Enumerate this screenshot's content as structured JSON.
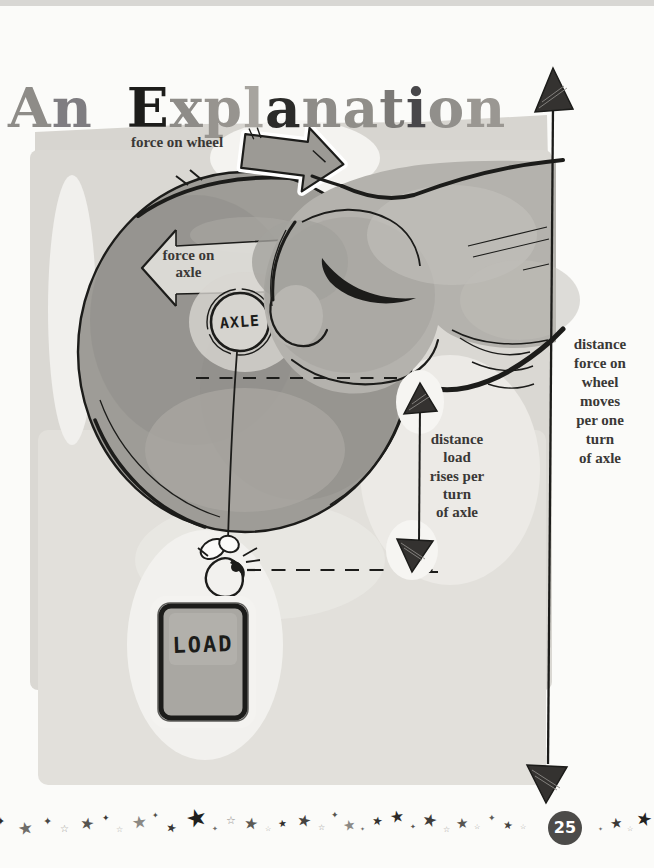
{
  "title": {
    "text": "An Explanation",
    "letters": [
      {
        "ch": "A",
        "color": "#8e8c88"
      },
      {
        "ch": "n",
        "color": "#7f7d81"
      },
      {
        "ch": " ",
        "color": ""
      },
      {
        "ch": "E",
        "color": "#1d1d1b"
      },
      {
        "ch": "x",
        "color": "#8e8c88"
      },
      {
        "ch": "p",
        "color": "#97948f"
      },
      {
        "ch": "l",
        "color": "#a7a49f"
      },
      {
        "ch": "a",
        "color": "#2b2b29"
      },
      {
        "ch": "n",
        "color": "#8e8c88"
      },
      {
        "ch": "a",
        "color": "#908e89"
      },
      {
        "ch": "t",
        "color": "#7b7976"
      },
      {
        "ch": "i",
        "color": "#48474a"
      },
      {
        "ch": "o",
        "color": "#918f8b"
      },
      {
        "ch": "n",
        "color": "#9a9792"
      }
    ]
  },
  "diagram": {
    "force_on_wheel_label": "force on wheel",
    "force_on_axle_label": "force on\naxle",
    "axle_label": "AXLE",
    "load_label": "LOAD",
    "distance_load_label": "distance\nload\nrises per\nturn\nof axle",
    "distance_wheel_label": "distance\nforce on\nwheel\nmoves\nper one\nturn\nof axle",
    "palette": {
      "wash": "#dad8d3",
      "wheel": "#9e9c97",
      "hand": "#b4b2ad",
      "ink": "#1c1c1a",
      "label_text": "#3a3836",
      "page_circle": "#4c4b49"
    }
  },
  "footer": {
    "page_number": "25",
    "stars": [
      {
        "x": -4,
        "y": 816,
        "glyph": "✦",
        "size": 11,
        "color": "#2e2c2a",
        "rot": 0
      },
      {
        "x": 18,
        "y": 820,
        "glyph": "★",
        "size": 17,
        "color": "#6f6d69",
        "rot": -12
      },
      {
        "x": 43,
        "y": 816,
        "glyph": "✦",
        "size": 11,
        "color": "#4a4846",
        "rot": 0
      },
      {
        "x": 60,
        "y": 824,
        "glyph": "☆",
        "size": 10,
        "color": "#9b9995",
        "rot": 0
      },
      {
        "x": 80,
        "y": 816,
        "glyph": "★",
        "size": 16,
        "color": "#55534f",
        "rot": 10
      },
      {
        "x": 102,
        "y": 814,
        "glyph": "✦",
        "size": 9,
        "color": "#3a3836",
        "rot": 0
      },
      {
        "x": 116,
        "y": 826,
        "glyph": "☆",
        "size": 8,
        "color": "#a9a7a3",
        "rot": 0
      },
      {
        "x": 132,
        "y": 814,
        "glyph": "★",
        "size": 17,
        "color": "#8b8985",
        "rot": -8
      },
      {
        "x": 152,
        "y": 812,
        "glyph": "✦",
        "size": 8,
        "color": "#4e4c48",
        "rot": 0
      },
      {
        "x": 166,
        "y": 822,
        "glyph": "★",
        "size": 12,
        "color": "#3a3836",
        "rot": 14
      },
      {
        "x": 186,
        "y": 806,
        "glyph": "★",
        "size": 24,
        "color": "#201f1d",
        "rot": -16
      },
      {
        "x": 212,
        "y": 826,
        "glyph": "✦",
        "size": 7,
        "color": "#6f6d69",
        "rot": 0
      },
      {
        "x": 226,
        "y": 815,
        "glyph": "☆",
        "size": 11,
        "color": "#8f8d89",
        "rot": 0
      },
      {
        "x": 244,
        "y": 816,
        "glyph": "★",
        "size": 16,
        "color": "#5b5955",
        "rot": 8
      },
      {
        "x": 265,
        "y": 826,
        "glyph": "☆",
        "size": 7,
        "color": "#9b9995",
        "rot": 0
      },
      {
        "x": 278,
        "y": 819,
        "glyph": "★",
        "size": 10,
        "color": "#302e2c",
        "rot": -8
      },
      {
        "x": 297,
        "y": 813,
        "glyph": "★",
        "size": 16,
        "color": "#454340",
        "rot": 12
      },
      {
        "x": 318,
        "y": 824,
        "glyph": "☆",
        "size": 8,
        "color": "#8f8d89",
        "rot": 0
      },
      {
        "x": 331,
        "y": 811,
        "glyph": "✦",
        "size": 9,
        "color": "#56544f",
        "rot": 0
      },
      {
        "x": 343,
        "y": 818,
        "glyph": "★",
        "size": 14,
        "color": "#8b8985",
        "rot": -12
      },
      {
        "x": 360,
        "y": 826,
        "glyph": "✦",
        "size": 6,
        "color": "#6f6d69",
        "rot": 0
      },
      {
        "x": 372,
        "y": 815,
        "glyph": "★",
        "size": 12,
        "color": "#343230",
        "rot": 8
      },
      {
        "x": 390,
        "y": 809,
        "glyph": "★",
        "size": 16,
        "color": "#2b2927",
        "rot": -10
      },
      {
        "x": 410,
        "y": 824,
        "glyph": "✦",
        "size": 7,
        "color": "#56544f",
        "rot": 0
      },
      {
        "x": 422,
        "y": 812,
        "glyph": "★",
        "size": 17,
        "color": "#3e3c3a",
        "rot": 14
      },
      {
        "x": 443,
        "y": 826,
        "glyph": "☆",
        "size": 8,
        "color": "#9b9995",
        "rot": 0
      },
      {
        "x": 456,
        "y": 816,
        "glyph": "★",
        "size": 14,
        "color": "#575551",
        "rot": -6
      },
      {
        "x": 474,
        "y": 824,
        "glyph": "☆",
        "size": 7,
        "color": "#8f8d89",
        "rot": 0
      },
      {
        "x": 488,
        "y": 814,
        "glyph": "✦",
        "size": 9,
        "color": "#5e5c58",
        "rot": 0
      },
      {
        "x": 503,
        "y": 820,
        "glyph": "★",
        "size": 11,
        "color": "#44423e",
        "rot": 10
      },
      {
        "x": 520,
        "y": 824,
        "glyph": "☆",
        "size": 7,
        "color": "#9b9995",
        "rot": 0
      },
      {
        "x": 598,
        "y": 826,
        "glyph": "✦",
        "size": 6,
        "color": "#6f6d69",
        "rot": 0
      },
      {
        "x": 610,
        "y": 816,
        "glyph": "★",
        "size": 14,
        "color": "#3a3836",
        "rot": -8
      },
      {
        "x": 627,
        "y": 826,
        "glyph": "☆",
        "size": 7,
        "color": "#9b9995",
        "rot": 0
      },
      {
        "x": 636,
        "y": 810,
        "glyph": "★",
        "size": 18,
        "color": "#232220",
        "rot": 12
      }
    ]
  }
}
